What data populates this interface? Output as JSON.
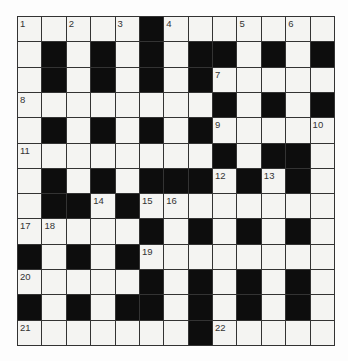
{
  "puzzle": {
    "rows": 13,
    "cols": 13,
    "colors": {
      "block": "#0d0d0d",
      "open": "#f4f4f2",
      "grid_line": "#333333",
      "number_text": "#333333"
    },
    "grid": [
      "....._.......",
      "._._._.__._._",
      "._._._._.....",
      "........_._._",
      "._._._._.....",
      "........_.__.",
      "._._.___._._.",
      ".__._........",
      "....._._._._.",
      "_._._........",
      "....._._._._.",
      "_._.__._._._.",
      "......._....."
    ],
    "numbers": [
      {
        "row": 0,
        "col": 0,
        "n": "1"
      },
      {
        "row": 0,
        "col": 2,
        "n": "2"
      },
      {
        "row": 0,
        "col": 4,
        "n": "3"
      },
      {
        "row": 0,
        "col": 6,
        "n": "4"
      },
      {
        "row": 0,
        "col": 9,
        "n": "5"
      },
      {
        "row": 0,
        "col": 11,
        "n": "6"
      },
      {
        "row": 2,
        "col": 8,
        "n": "7"
      },
      {
        "row": 3,
        "col": 0,
        "n": "8"
      },
      {
        "row": 4,
        "col": 8,
        "n": "9"
      },
      {
        "row": 4,
        "col": 12,
        "n": "10"
      },
      {
        "row": 5,
        "col": 0,
        "n": "11"
      },
      {
        "row": 6,
        "col": 8,
        "n": "12"
      },
      {
        "row": 6,
        "col": 10,
        "n": "13"
      },
      {
        "row": 7,
        "col": 3,
        "n": "14"
      },
      {
        "row": 7,
        "col": 5,
        "n": "15"
      },
      {
        "row": 7,
        "col": 6,
        "n": "16"
      },
      {
        "row": 8,
        "col": 0,
        "n": "17"
      },
      {
        "row": 8,
        "col": 1,
        "n": "18"
      },
      {
        "row": 9,
        "col": 5,
        "n": "19"
      },
      {
        "row": 10,
        "col": 0,
        "n": "20"
      },
      {
        "row": 12,
        "col": 0,
        "n": "21"
      },
      {
        "row": 12,
        "col": 8,
        "n": "22"
      }
    ],
    "letters": []
  }
}
